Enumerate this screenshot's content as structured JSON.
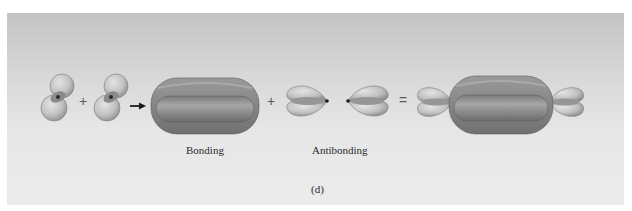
{
  "figure": {
    "panel_label": "(d)",
    "labels": {
      "bonding": "Bonding",
      "antibonding": "Antibonding"
    },
    "operators": {
      "plus_1": "+",
      "plus_2": "+",
      "equals": "="
    },
    "colors": {
      "background_top": "#c4c4c4",
      "background_bottom": "#ececec",
      "lobe_dark": "#8a8a8a",
      "lobe_light": "#c8c8c8",
      "nucleus": "#1a1a1a"
    }
  }
}
